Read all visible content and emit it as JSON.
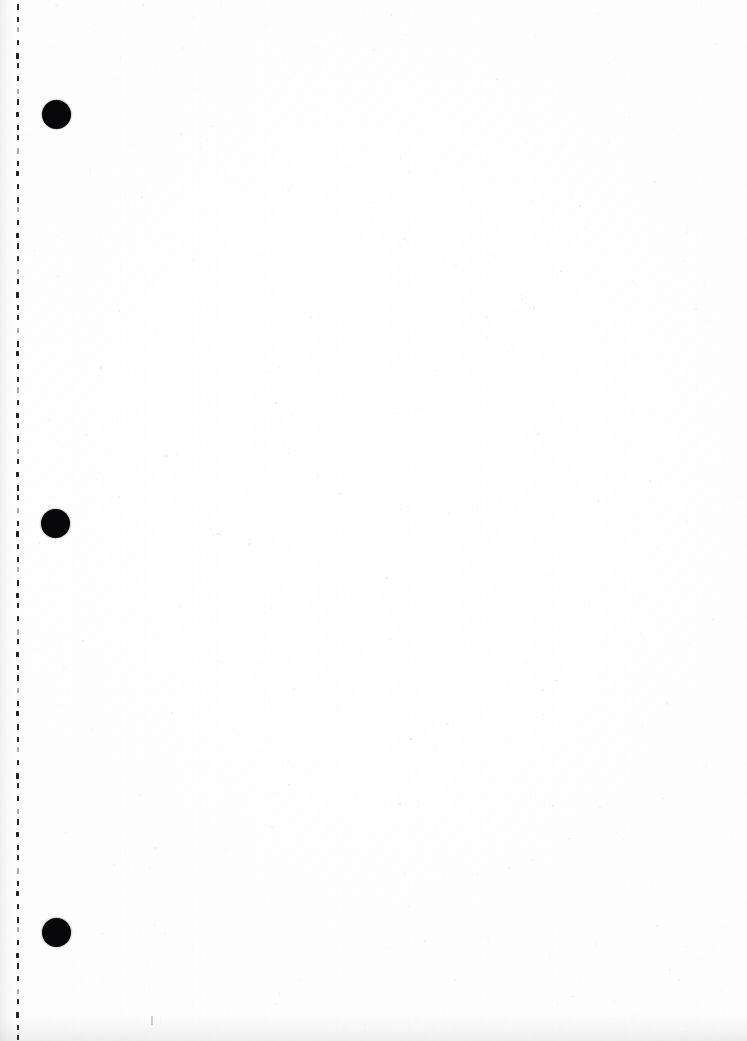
{
  "document": {
    "title": "Scanned Blank Page",
    "page_type": "blank-scanned-sheet",
    "width_px": 747,
    "height_px": 1041,
    "background_color": "#fdfdfd",
    "ink_color": "#07070a",
    "content_text": "",
    "note": ""
  },
  "left_margin": {
    "perforation_column": {
      "name": "perforation-tick-column",
      "x_px": 17,
      "tick_spacing_px": 12,
      "tick_width_px": 2,
      "tick_height_px": 5,
      "tick_color": "#242428",
      "first_tick_y_px": 4,
      "tick_count": 86
    },
    "punch_dots": [
      {
        "label": "punch-dot-1",
        "cx_px": 56,
        "cy_px": 114,
        "diameter_px": 29,
        "color": "#07070a"
      },
      {
        "label": "punch-dot-2",
        "cx_px": 55,
        "cy_px": 523,
        "diameter_px": 29,
        "color": "#07070a"
      },
      {
        "label": "punch-dot-3",
        "cx_px": 56,
        "cy_px": 932,
        "diameter_px": 29,
        "color": "#07070a"
      }
    ]
  },
  "body": {
    "region_label": "blank-content-area",
    "text": "",
    "is_empty": true
  },
  "artifacts": {
    "stray_mark": {
      "label": "stray-pencil-mark",
      "x_px": 151,
      "y_px": 1016
    },
    "bottom_edge_shadow": {
      "label": "bottom-edge-shadow",
      "height_px": 26
    },
    "left_gutter_shadow": {
      "label": "left-gutter-shadow",
      "width_px": 14
    }
  }
}
